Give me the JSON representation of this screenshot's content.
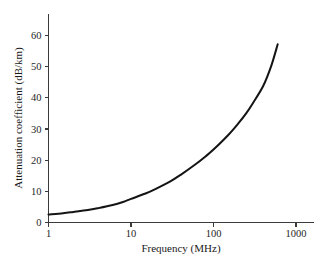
{
  "chart_data": {
    "type": "line",
    "title": "",
    "xlabel": "Frequency (MHz)",
    "ylabel": "Attenuation coefficient (dB/km)",
    "xscale": "log",
    "yscale": "linear",
    "xlim": [
      1,
      1000
    ],
    "ylim": [
      0,
      65
    ],
    "grid": false,
    "legend": false,
    "xticks": [
      1,
      10,
      100,
      1000
    ],
    "xtick_labels": [
      "1",
      "10",
      "100",
      "1000"
    ],
    "yticks": [
      0,
      10,
      20,
      30,
      40,
      50,
      60
    ],
    "ytick_labels": [
      "0",
      "10",
      "20",
      "30",
      "40",
      "50",
      "60"
    ],
    "series": [
      {
        "name": "Attenuation coefficient",
        "color": "#141414",
        "x": [
          1,
          1.5,
          2,
          3,
          4,
          6,
          8,
          10,
          15,
          20,
          30,
          40,
          60,
          80,
          100,
          150,
          200,
          250,
          300,
          400,
          500,
          600
        ],
        "y": [
          2.6,
          3.0,
          3.4,
          4.0,
          4.6,
          5.6,
          6.6,
          7.6,
          9.3,
          10.8,
          13.2,
          15.3,
          18.6,
          21.2,
          23.4,
          28.0,
          31.8,
          35.1,
          38.3,
          43.8,
          50.2,
          57.2
        ]
      }
    ]
  },
  "axis_titles": {
    "x": "Frequency (MHz)",
    "y": "Attenuation coefficient (dB/km)"
  }
}
